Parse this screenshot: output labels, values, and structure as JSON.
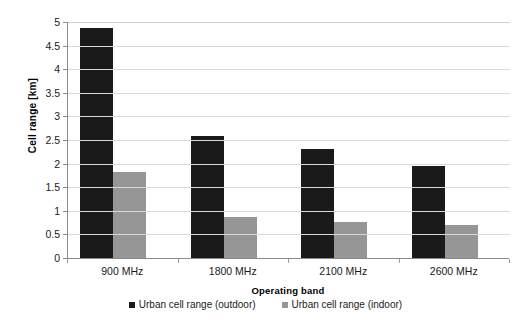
{
  "chart_data": {
    "type": "bar",
    "title": "",
    "xlabel": "Operating band",
    "ylabel": "Cell range [km]",
    "categories": [
      "900 MHz",
      "1800 MHz",
      "2100 MHz",
      "2600 MHz"
    ],
    "series": [
      {
        "name": "Urban cell range (outdoor)",
        "color": "#1a1a1a",
        "values": [
          4.88,
          2.59,
          2.3,
          1.96
        ]
      },
      {
        "name": "Urban cell range (indoor)",
        "color": "#969696",
        "values": [
          1.83,
          0.86,
          0.77,
          0.69
        ]
      }
    ],
    "ylim": [
      0,
      5
    ],
    "ytick_values": [
      0,
      0.5,
      1,
      1.5,
      2,
      2.5,
      3,
      3.5,
      4,
      4.5,
      5
    ],
    "ytick_labels": [
      "0",
      "0.5",
      "1",
      "1.5",
      "2",
      "2.5",
      "3",
      "3.5",
      "4",
      "4.5",
      "5"
    ],
    "grid": true,
    "grid_axis": "y",
    "legend_position": "bottom"
  },
  "axes": {
    "y_title": "Cell range [km]",
    "x_title": "Operating band"
  },
  "legend": {
    "items": [
      {
        "label": "Urban cell range (outdoor)"
      },
      {
        "label": "Urban cell range (indoor)"
      }
    ]
  }
}
